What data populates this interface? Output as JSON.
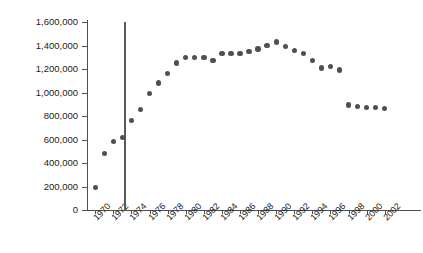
{
  "chart_data": {
    "type": "scatter",
    "title": "",
    "xlabel": "",
    "ylabel": "Number of legal abortions",
    "xlim": [
      1969.2,
      2002.8
    ],
    "ylim": [
      0,
      1600000
    ],
    "grid": false,
    "legend": "none",
    "y_tick_labels": [
      "0",
      "200,000",
      "400,000",
      "600,000",
      "800,000",
      "1,000,000",
      "1,200,000",
      "1,400,000",
      "1,600,000"
    ],
    "y_tick_values": [
      0,
      200000,
      400000,
      600000,
      800000,
      1000000,
      1200000,
      1400000,
      1600000
    ],
    "x_tick_labels": [
      "1970",
      "1972",
      "1974",
      "1976",
      "1978",
      "1980",
      "1982",
      "1984",
      "1986",
      "1988",
      "1990",
      "1992",
      "1994",
      "1996",
      "1998",
      "2000",
      "2002"
    ],
    "x_tick_values": [
      1970,
      1972,
      1974,
      1976,
      1978,
      1980,
      1982,
      1984,
      1986,
      1988,
      1990,
      1992,
      1994,
      1996,
      1998,
      2000,
      2002
    ],
    "marker_color": "#4f4f57",
    "axis_color": "#4d4d4d",
    "annotations": [
      {
        "name": "roe-v-wade-line",
        "type": "vline",
        "x": 1973.2,
        "label": "",
        "color": "#5a5a5a"
      }
    ],
    "x": [
      1970,
      1971,
      1972,
      1973,
      1974,
      1975,
      1976,
      1977,
      1978,
      1979,
      1980,
      1981,
      1982,
      1983,
      1984,
      1985,
      1986,
      1987,
      1988,
      1989,
      1990,
      1991,
      1992,
      1993,
      1994,
      1995,
      1996,
      1997,
      1998,
      1999,
      2000,
      2001,
      2002
    ],
    "values": [
      190000,
      480000,
      585000,
      615000,
      763000,
      855000,
      990000,
      1080000,
      1160000,
      1250000,
      1300000,
      1300000,
      1300000,
      1270000,
      1330000,
      1330000,
      1330000,
      1350000,
      1370000,
      1400000,
      1430000,
      1390000,
      1360000,
      1330000,
      1270000,
      1210000,
      1220000,
      1190000,
      895000,
      880000,
      875000,
      875000,
      865000
    ]
  }
}
